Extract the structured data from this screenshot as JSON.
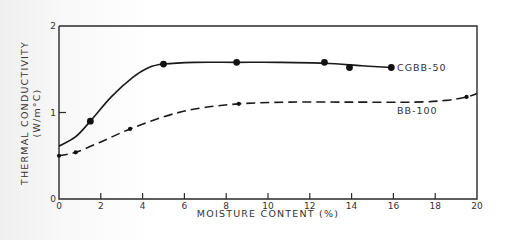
{
  "chart_data": {
    "type": "line",
    "title": "",
    "xlabel": "MOISTURE CONTENT (%)",
    "ylabel": "THERMAL CONDUCTIVITY",
    "ylabel_units": "(W/m°C)",
    "xlim": [
      0,
      20
    ],
    "ylim": [
      0,
      2
    ],
    "x_ticks": [
      0,
      2,
      4,
      6,
      8,
      10,
      12,
      14,
      16,
      18,
      20
    ],
    "x_tick_labels": [
      "0",
      "2",
      "4",
      "6",
      "8",
      "10",
      "12",
      "14",
      "16",
      "18",
      "20"
    ],
    "y_ticks": [
      0,
      1,
      2
    ],
    "y_tick_labels": [
      "0",
      "1",
      "2"
    ],
    "grid": false,
    "legend": "inline labels at right end of curves",
    "series": [
      {
        "name": "CGBB-50",
        "line_style": "solid",
        "marker": "large-dot",
        "points": [
          {
            "x": 1.5,
            "y": 0.9
          },
          {
            "x": 5.0,
            "y": 1.56
          },
          {
            "x": 8.5,
            "y": 1.58
          },
          {
            "x": 12.7,
            "y": 1.58
          },
          {
            "x": 13.9,
            "y": 1.52
          },
          {
            "x": 15.9,
            "y": 1.52
          }
        ],
        "curve": [
          {
            "x": 0,
            "y": 0.61
          },
          {
            "x": 0.8,
            "y": 0.72
          },
          {
            "x": 1.5,
            "y": 0.9
          },
          {
            "x": 2.5,
            "y": 1.18
          },
          {
            "x": 3.5,
            "y": 1.4
          },
          {
            "x": 4.3,
            "y": 1.52
          },
          {
            "x": 5.0,
            "y": 1.56
          },
          {
            "x": 6.5,
            "y": 1.58
          },
          {
            "x": 8.5,
            "y": 1.58
          },
          {
            "x": 10.5,
            "y": 1.58
          },
          {
            "x": 12.7,
            "y": 1.57
          },
          {
            "x": 14.5,
            "y": 1.54
          },
          {
            "x": 15.9,
            "y": 1.52
          }
        ]
      },
      {
        "name": "BB-100",
        "line_style": "dashed",
        "marker": "small-dot",
        "points": [
          {
            "x": 0,
            "y": 0.5
          },
          {
            "x": 0.8,
            "y": 0.54
          },
          {
            "x": 3.4,
            "y": 0.81
          },
          {
            "x": 8.6,
            "y": 1.1
          },
          {
            "x": 19.5,
            "y": 1.18
          }
        ],
        "curve": [
          {
            "x": 0,
            "y": 0.5
          },
          {
            "x": 0.8,
            "y": 0.54
          },
          {
            "x": 2.0,
            "y": 0.66
          },
          {
            "x": 3.4,
            "y": 0.81
          },
          {
            "x": 5.0,
            "y": 0.95
          },
          {
            "x": 6.5,
            "y": 1.04
          },
          {
            "x": 8.6,
            "y": 1.1
          },
          {
            "x": 11.0,
            "y": 1.12
          },
          {
            "x": 14.0,
            "y": 1.12
          },
          {
            "x": 17.0,
            "y": 1.12
          },
          {
            "x": 18.5,
            "y": 1.14
          },
          {
            "x": 19.5,
            "y": 1.18
          },
          {
            "x": 20.0,
            "y": 1.22
          }
        ]
      }
    ]
  }
}
